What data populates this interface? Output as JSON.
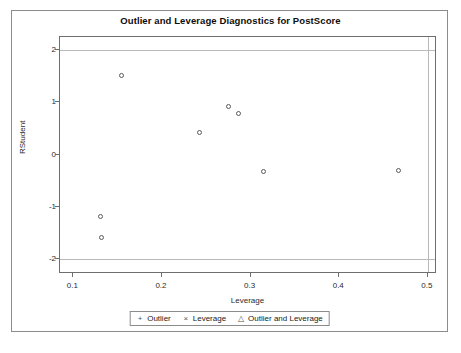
{
  "chart_data": {
    "type": "scatter",
    "title": "Outlier and Leverage Diagnostics for PostScore",
    "xlabel": "Leverage",
    "ylabel": "RStudent",
    "xlim": [
      0.085,
      0.508
    ],
    "ylim": [
      -2.25,
      2.25
    ],
    "xticks": [
      0.1,
      0.2,
      0.3,
      0.4,
      0.5
    ],
    "xtick_labels": [
      "0.1",
      "0.2",
      "0.3",
      "0.4",
      "0.5"
    ],
    "yticks": [
      2,
      1,
      0,
      -1,
      -2
    ],
    "ytick_labels": [
      "2",
      "1",
      "0",
      "-1",
      "-2"
    ],
    "grid": false,
    "reference_lines": {
      "horizontal": [
        2,
        -2
      ],
      "vertical": [
        0.5
      ]
    },
    "points": [
      {
        "x": 0.131,
        "y": -1.19
      },
      {
        "x": 0.132,
        "y": -1.58
      },
      {
        "x": 0.154,
        "y": 1.52
      },
      {
        "x": 0.242,
        "y": 0.43
      },
      {
        "x": 0.275,
        "y": 0.92
      },
      {
        "x": 0.286,
        "y": 0.79
      },
      {
        "x": 0.314,
        "y": -0.32
      },
      {
        "x": 0.467,
        "y": -0.31
      }
    ],
    "marker_style": "open-circle",
    "legend_position": "bottom",
    "legend": [
      {
        "glyph": "+",
        "label": "Outlier"
      },
      {
        "glyph": "×",
        "label": "Leverage"
      },
      {
        "glyph": "△",
        "label": "Outlier and Leverage"
      }
    ]
  }
}
